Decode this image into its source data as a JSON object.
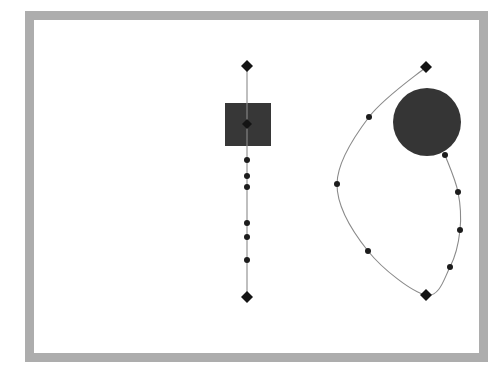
{
  "figure": {
    "title": "",
    "background_color": "#ffffff",
    "frame": {
      "name": "outer-border-frame",
      "color": "#adadad",
      "x": 25,
      "y": 11,
      "width": 463,
      "height": 351,
      "thickness": 9
    },
    "interior_color": "#ffffff"
  },
  "chart_data": {
    "type": "scatter",
    "title": "",
    "subtitle": "",
    "xlabel": "",
    "ylabel": "",
    "xlim": [
      25,
      488
    ],
    "ylim": [
      11,
      362
    ],
    "grid": false,
    "legend": null,
    "annotations": [],
    "shapes": [
      {
        "name": "filled-square",
        "type": "rect",
        "x": 225,
        "y": 103,
        "width": 46,
        "height": 43,
        "fill": "#373737"
      },
      {
        "name": "filled-circle",
        "type": "circle",
        "cx": 427,
        "cy": 122,
        "r": 34,
        "fill": "#353535"
      }
    ],
    "series": [
      {
        "name": "vertical-path",
        "kind": "polyline",
        "stroke": "#8a8a8a",
        "closed": false,
        "points": [
          {
            "x": 247,
            "y": 66,
            "marker": "diamond",
            "size": 6
          },
          {
            "x": 247,
            "y": 124,
            "marker": "diamond",
            "size": 5
          },
          {
            "x": 247,
            "y": 160,
            "marker": "dot",
            "size": 3
          },
          {
            "x": 247,
            "y": 176,
            "marker": "dot",
            "size": 3
          },
          {
            "x": 247,
            "y": 187,
            "marker": "dot",
            "size": 3
          },
          {
            "x": 247,
            "y": 223,
            "marker": "dot",
            "size": 3
          },
          {
            "x": 247,
            "y": 237,
            "marker": "dot",
            "size": 3
          },
          {
            "x": 247,
            "y": 260,
            "marker": "dot",
            "size": 3
          },
          {
            "x": 247,
            "y": 297,
            "marker": "diamond",
            "size": 6
          }
        ]
      },
      {
        "name": "loop-path",
        "kind": "curve",
        "stroke": "#8a8a8a",
        "closed": false,
        "points": [
          {
            "x": 426,
            "y": 67,
            "marker": "diamond",
            "size": 6
          },
          {
            "x": 369,
            "y": 117,
            "marker": "dot",
            "size": 3
          },
          {
            "x": 337,
            "y": 184,
            "marker": "dot",
            "size": 3
          },
          {
            "x": 368,
            "y": 251,
            "marker": "dot",
            "size": 3
          },
          {
            "x": 426,
            "y": 295,
            "marker": "diamond",
            "size": 6
          },
          {
            "x": 450,
            "y": 267,
            "marker": "dot",
            "size": 3
          },
          {
            "x": 460,
            "y": 230,
            "marker": "dot",
            "size": 3
          },
          {
            "x": 458,
            "y": 192,
            "marker": "dot",
            "size": 3
          },
          {
            "x": 445,
            "y": 155,
            "marker": "dot",
            "size": 3
          }
        ]
      }
    ]
  }
}
